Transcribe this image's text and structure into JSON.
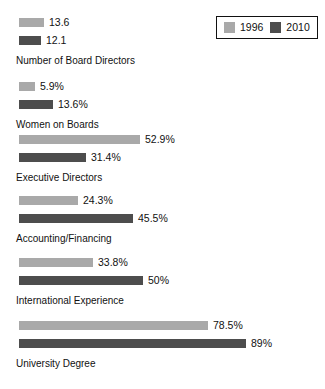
{
  "chart_data": {
    "type": "bar",
    "orientation": "horizontal",
    "title": "",
    "subtitle": "",
    "xlabel": "",
    "ylabel": "",
    "grid": false,
    "legend_position": "top-right",
    "legend": [
      {
        "name": "1996",
        "color": "#a9a9a9"
      },
      {
        "name": "2010",
        "color": "#4d4d4d"
      }
    ],
    "series": [
      {
        "name": "1996",
        "color": "#a9a9a9"
      },
      {
        "name": "2010",
        "color": "#4d4d4d"
      }
    ],
    "categories": [
      "Number of Board Directors",
      "Women on Boards",
      "Executive Directors",
      "Accounting/Financing",
      "International Experience",
      "University Degree"
    ],
    "groups": [
      {
        "label": "Number of Board Directors",
        "unit": "count",
        "bars": [
          {
            "series": "1996",
            "value": 13.6,
            "label": "13.6",
            "color": "#a9a9a9",
            "px_width": 25
          },
          {
            "series": "2010",
            "value": 12.1,
            "label": "12.1",
            "color": "#4d4d4d",
            "px_width": 22
          }
        ]
      },
      {
        "label": "Women on Boards",
        "unit": "percent",
        "bars": [
          {
            "series": "1996",
            "value": 5.9,
            "label": "5.9%",
            "color": "#a9a9a9",
            "px_width": 16
          },
          {
            "series": "2010",
            "value": 13.6,
            "label": "13.6%",
            "color": "#4d4d4d",
            "px_width": 34
          }
        ]
      },
      {
        "label": "Executive Directors",
        "unit": "percent",
        "bars": [
          {
            "series": "1996",
            "value": 52.9,
            "label": "52.9%",
            "color": "#a9a9a9",
            "px_width": 121
          },
          {
            "series": "2010",
            "value": 31.4,
            "label": "31.4%",
            "color": "#4d4d4d",
            "px_width": 67
          }
        ]
      },
      {
        "label": "Accounting/Financing",
        "unit": "percent",
        "bars": [
          {
            "series": "1996",
            "value": 24.3,
            "label": "24.3%",
            "color": "#a9a9a9",
            "px_width": 59
          },
          {
            "series": "2010",
            "value": 45.5,
            "label": "45.5%",
            "color": "#4d4d4d",
            "px_width": 114
          }
        ]
      },
      {
        "label": "International Experience",
        "unit": "percent",
        "bars": [
          {
            "series": "1996",
            "value": 33.8,
            "label": "33.8%",
            "color": "#a9a9a9",
            "px_width": 74
          },
          {
            "series": "2010",
            "value": 50,
            "label": "50%",
            "color": "#4d4d4d",
            "px_width": 124
          }
        ]
      },
      {
        "label": "University Degree",
        "unit": "percent",
        "bars": [
          {
            "series": "1996",
            "value": 78.5,
            "label": "78.5%",
            "color": "#a9a9a9",
            "px_width": 189
          },
          {
            "series": "2010",
            "value": 89,
            "label": "89%",
            "color": "#4d4d4d",
            "px_width": 227
          }
        ]
      }
    ]
  },
  "layout": {
    "group_tops": [
      18,
      82,
      135,
      196,
      258,
      321
    ],
    "bar_left": 19,
    "bar_height": 9,
    "bar_gap": 9,
    "value_gap": 5
  }
}
